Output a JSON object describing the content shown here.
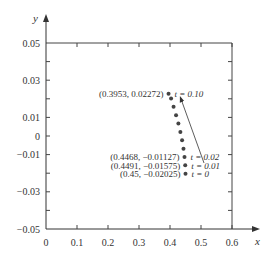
{
  "chart_data": {
    "type": "scatter",
    "title": "",
    "xlabel": "x",
    "ylabel": "y",
    "xlim": [
      0,
      0.6
    ],
    "ylim": [
      -0.05,
      0.05
    ],
    "xticks": [
      "0",
      "0.1",
      "0.2",
      "0.3",
      "0.4",
      "0.5",
      "0.6"
    ],
    "yticks": [
      "0.05",
      "0.03",
      "0.01",
      "0",
      "−0.01",
      "−0.03",
      "−0.05"
    ],
    "grid": false,
    "points": [
      {
        "x": 0.45,
        "y": -0.02025,
        "t": 0
      },
      {
        "x": 0.4491,
        "y": -0.01575,
        "t": 0.01
      },
      {
        "x": 0.4468,
        "y": -0.01127,
        "t": 0.02
      },
      {
        "x": 0.4435,
        "y": -0.0068,
        "t": 0.03
      },
      {
        "x": 0.439,
        "y": -0.0023,
        "t": 0.04
      },
      {
        "x": 0.4335,
        "y": 0.0022,
        "t": 0.05
      },
      {
        "x": 0.427,
        "y": 0.0067,
        "t": 0.06
      },
      {
        "x": 0.4195,
        "y": 0.0112,
        "t": 0.07
      },
      {
        "x": 0.4115,
        "y": 0.0157,
        "t": 0.08
      },
      {
        "x": 0.4035,
        "y": 0.0202,
        "t": 0.09
      },
      {
        "x": 0.3953,
        "y": 0.02272,
        "t": 0.1
      }
    ],
    "annotations": [
      {
        "text": "(0.3953, 0.02272)",
        "t_label": "t = 0.10"
      },
      {
        "text": "(0.4468, −0.01127)",
        "t_label": "t = 0.02"
      },
      {
        "text": "(0.4491, −0.01575)",
        "t_label": "t = 0.01"
      },
      {
        "text": "(0.45, −0.02025)",
        "t_label": "t = 0"
      }
    ],
    "arrow": {
      "from_label": "t = 0.02",
      "to_label": "t = 0.10"
    }
  }
}
